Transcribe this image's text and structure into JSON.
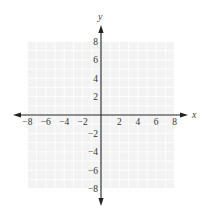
{
  "diagram": {
    "type": "coordinate-plane",
    "axes": {
      "x_label": "x",
      "y_label": "y",
      "x_range": [
        -8,
        8
      ],
      "y_range": [
        -8,
        8
      ],
      "x_ticks": [
        "−8",
        "−6",
        "−4",
        "−2",
        "2",
        "4",
        "6",
        "8"
      ],
      "x_tick_values": [
        -8,
        -6,
        -4,
        -2,
        2,
        4,
        6,
        8
      ],
      "y_ticks": [
        "8",
        "6",
        "4",
        "2",
        "−2",
        "−4",
        "−6",
        "−8"
      ],
      "y_tick_values": [
        8,
        6,
        4,
        2,
        -2,
        -4,
        -6,
        -8
      ]
    },
    "grid": {
      "visible": true,
      "step": 1,
      "color": "#e4e4e4",
      "background": "#f3f3f3"
    },
    "colors": {
      "axis": "#222222",
      "text": "#333333"
    }
  }
}
